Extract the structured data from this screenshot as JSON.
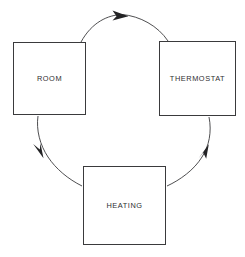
{
  "diagram": {
    "background_color": "#ffffff",
    "line_color": "#3a3a3c",
    "text_color": "#2e2e30",
    "nodes": [
      {
        "id": "room",
        "label": "ROOM"
      },
      {
        "id": "thermostat",
        "label": "THERMOSTAT"
      },
      {
        "id": "heating",
        "label": "HEATING"
      }
    ],
    "edges": [
      {
        "id": "room-to-thermostat",
        "from": "ROOM",
        "to": "THERMOSTAT",
        "style": "curved-arrow",
        "direction": "clockwise"
      },
      {
        "id": "thermostat-to-heating",
        "from": "THERMOSTAT",
        "to": "HEATING",
        "style": "curved-arrow",
        "direction": "clockwise"
      },
      {
        "id": "heating-to-room",
        "from": "HEATING",
        "to": "ROOM",
        "style": "curved-arrow",
        "direction": "clockwise"
      }
    ]
  }
}
